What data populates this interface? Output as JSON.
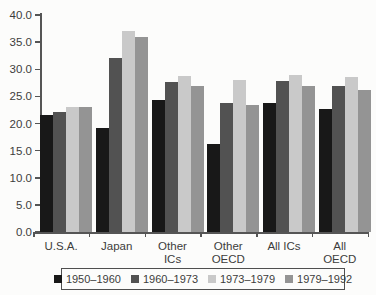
{
  "chart_data": {
    "type": "bar",
    "title": "",
    "xlabel": "",
    "ylabel": "",
    "categories": [
      "U.S.A.",
      "Japan",
      "Other\nICs",
      "Other\nOECD",
      "All ICs",
      "All\nOECD"
    ],
    "series": [
      {
        "name": "1950–1960",
        "color": "#181818",
        "values": [
          21.5,
          19.2,
          24.4,
          16.3,
          23.8,
          22.7
        ]
      },
      {
        "name": "1960–1973",
        "color": "#525252",
        "values": [
          22.1,
          32.1,
          27.7,
          23.7,
          27.8,
          26.9
        ]
      },
      {
        "name": "1973–1979",
        "color": "#c9c9c9",
        "values": [
          23.1,
          37.0,
          28.8,
          28.0,
          28.9,
          28.5
        ]
      },
      {
        "name": "1979–1992",
        "color": "#949494",
        "values": [
          23.1,
          35.9,
          26.9,
          23.4,
          26.9,
          26.2
        ]
      }
    ],
    "ylim": [
      0,
      40
    ],
    "ytick_step": 5,
    "ytick_labels": [
      "0.0",
      "5.0",
      "10.0",
      "15.0",
      "20.0",
      "25.0",
      "30.0",
      "35.0",
      "40.0"
    ],
    "grid": false,
    "legend_position": "bottom-box"
  }
}
